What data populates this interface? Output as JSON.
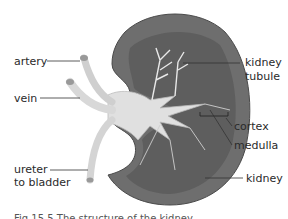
{
  "figure": {
    "title": "Structure of the kidney",
    "labels": {
      "artery": "artery",
      "vein": "vein",
      "ureter_line1": "ureter",
      "ureter_line2": "to bladder",
      "tubule_line1": "kidney",
      "tubule_line2": "tubule",
      "cortex": "cortex",
      "medulla": "medulla",
      "kidney": "kidney"
    },
    "caption": "Fig 15.5 The structure of the kidney",
    "colors": {
      "cortex": "#6e6e6e",
      "medulla": "#5a5a5a",
      "vessels": "#d4d4d4",
      "pelvis": "#e2e2e2",
      "lines": "#333333"
    }
  }
}
